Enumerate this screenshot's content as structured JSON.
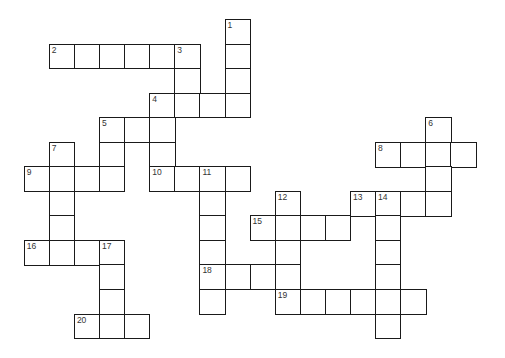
{
  "puzzle": {
    "type": "crossword",
    "grid": {
      "origin_x": 23.7,
      "origin_y": 18.9,
      "cell_w": 25.1,
      "cell_h": 24.55,
      "line_color": "#1a1a1a",
      "number_color": "#333333"
    },
    "cells": [
      {
        "c": 8,
        "r": 0,
        "n": "1"
      },
      {
        "c": 1,
        "r": 1,
        "n": "2"
      },
      {
        "c": 2,
        "r": 1
      },
      {
        "c": 3,
        "r": 1
      },
      {
        "c": 4,
        "r": 1
      },
      {
        "c": 5,
        "r": 1
      },
      {
        "c": 6,
        "r": 1,
        "n": "3"
      },
      {
        "c": 8,
        "r": 1
      },
      {
        "c": 6,
        "r": 2
      },
      {
        "c": 8,
        "r": 2
      },
      {
        "c": 5,
        "r": 3,
        "n": "4"
      },
      {
        "c": 6,
        "r": 3
      },
      {
        "c": 7,
        "r": 3
      },
      {
        "c": 8,
        "r": 3
      },
      {
        "c": 3,
        "r": 4,
        "n": "5"
      },
      {
        "c": 4,
        "r": 4
      },
      {
        "c": 5,
        "r": 4
      },
      {
        "c": 16,
        "r": 4,
        "n": "6"
      },
      {
        "c": 1,
        "r": 5,
        "n": "7"
      },
      {
        "c": 3,
        "r": 5
      },
      {
        "c": 5,
        "r": 5
      },
      {
        "c": 14,
        "r": 5,
        "n": "8"
      },
      {
        "c": 15,
        "r": 5
      },
      {
        "c": 16,
        "r": 5
      },
      {
        "c": 17,
        "r": 5
      },
      {
        "c": 0,
        "r": 6,
        "n": "9"
      },
      {
        "c": 1,
        "r": 6
      },
      {
        "c": 2,
        "r": 6
      },
      {
        "c": 3,
        "r": 6
      },
      {
        "c": 5,
        "r": 6,
        "n": "10"
      },
      {
        "c": 6,
        "r": 6
      },
      {
        "c": 7,
        "r": 6,
        "n": "11"
      },
      {
        "c": 8,
        "r": 6
      },
      {
        "c": 16,
        "r": 6
      },
      {
        "c": 1,
        "r": 7
      },
      {
        "c": 7,
        "r": 7
      },
      {
        "c": 10,
        "r": 7,
        "n": "12"
      },
      {
        "c": 13,
        "r": 7,
        "n": "13"
      },
      {
        "c": 14,
        "r": 7,
        "n": "14"
      },
      {
        "c": 15,
        "r": 7
      },
      {
        "c": 16,
        "r": 7
      },
      {
        "c": 1,
        "r": 8
      },
      {
        "c": 7,
        "r": 8
      },
      {
        "c": 9,
        "r": 8,
        "n": "15"
      },
      {
        "c": 10,
        "r": 8
      },
      {
        "c": 11,
        "r": 8
      },
      {
        "c": 12,
        "r": 8
      },
      {
        "c": 14,
        "r": 8
      },
      {
        "c": 0,
        "r": 9,
        "n": "16"
      },
      {
        "c": 1,
        "r": 9
      },
      {
        "c": 2,
        "r": 9
      },
      {
        "c": 3,
        "r": 9,
        "n": "17"
      },
      {
        "c": 7,
        "r": 9
      },
      {
        "c": 10,
        "r": 9
      },
      {
        "c": 14,
        "r": 9
      },
      {
        "c": 3,
        "r": 10
      },
      {
        "c": 7,
        "r": 10,
        "n": "18"
      },
      {
        "c": 8,
        "r": 10
      },
      {
        "c": 9,
        "r": 10
      },
      {
        "c": 10,
        "r": 10
      },
      {
        "c": 14,
        "r": 10
      },
      {
        "c": 3,
        "r": 11
      },
      {
        "c": 7,
        "r": 11
      },
      {
        "c": 10,
        "r": 11,
        "n": "19"
      },
      {
        "c": 11,
        "r": 11
      },
      {
        "c": 12,
        "r": 11
      },
      {
        "c": 13,
        "r": 11
      },
      {
        "c": 14,
        "r": 11
      },
      {
        "c": 15,
        "r": 11
      },
      {
        "c": 2,
        "r": 12,
        "n": "20"
      },
      {
        "c": 3,
        "r": 12
      },
      {
        "c": 4,
        "r": 12
      },
      {
        "c": 14,
        "r": 12
      }
    ],
    "entries": {
      "across": [
        {
          "n": "2",
          "length": 6
        },
        {
          "n": "4",
          "length": 4
        },
        {
          "n": "5",
          "length": 3
        },
        {
          "n": "8",
          "length": 4
        },
        {
          "n": "9",
          "length": 4
        },
        {
          "n": "10",
          "length": 4
        },
        {
          "n": "13",
          "length": 4
        },
        {
          "n": "15",
          "length": 4
        },
        {
          "n": "16",
          "length": 4
        },
        {
          "n": "18",
          "length": 4
        },
        {
          "n": "19",
          "length": 6
        },
        {
          "n": "20",
          "length": 3
        }
      ],
      "down": [
        {
          "n": "1",
          "length": 4
        },
        {
          "n": "3",
          "length": 3
        },
        {
          "n": "4",
          "length": 4
        },
        {
          "n": "5",
          "length": 3
        },
        {
          "n": "6",
          "length": 4
        },
        {
          "n": "7",
          "length": 5
        },
        {
          "n": "11",
          "length": 6
        },
        {
          "n": "12",
          "length": 5
        },
        {
          "n": "14",
          "length": 6
        },
        {
          "n": "17",
          "length": 4
        }
      ]
    }
  }
}
